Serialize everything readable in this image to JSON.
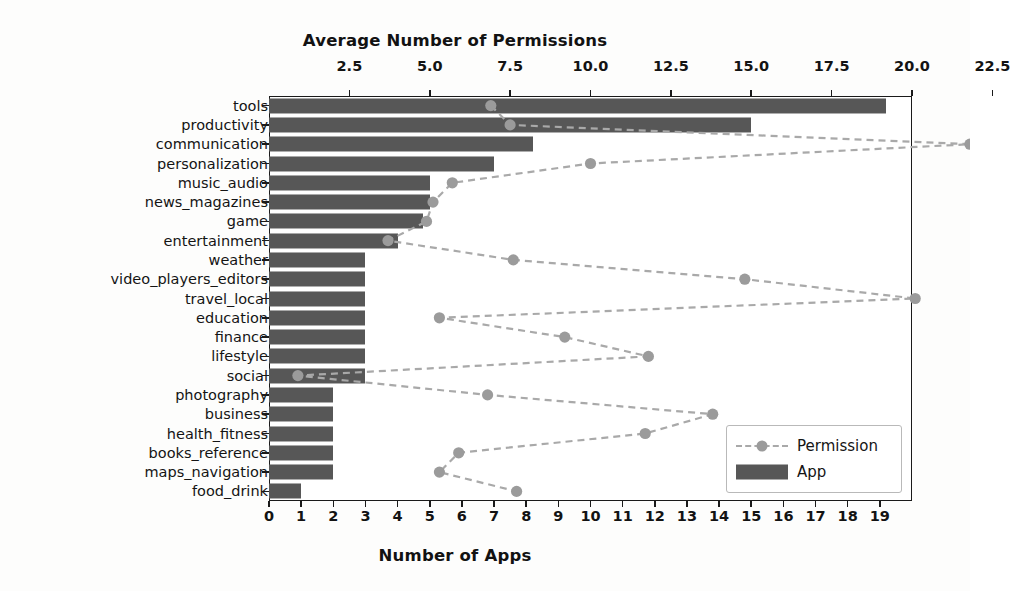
{
  "chart_data": {
    "type": "bar",
    "title": "",
    "xlabel": "Number of Apps",
    "ylabel": "",
    "top_axis_label": "Average Number of Permissions",
    "grid": false,
    "legend_position": "lower right",
    "orientation": "horizontal",
    "categories": [
      "tools",
      "productivity",
      "communication",
      "personalization",
      "music_audio",
      "news_magazines",
      "game",
      "entertainment",
      "weather",
      "video_players_editors",
      "travel_local",
      "education",
      "finance",
      "lifestyle",
      "social",
      "photography",
      "business",
      "health_fitness",
      "books_reference",
      "maps_navigation",
      "food_drink"
    ],
    "series": [
      {
        "name": "App",
        "axis": "bottom",
        "type": "bar",
        "color": "#575757",
        "values": [
          19.2,
          15.0,
          8.2,
          7.0,
          5.0,
          5.0,
          4.8,
          4.0,
          3.0,
          3.0,
          3.0,
          3.0,
          3.0,
          3.0,
          3.0,
          2.0,
          2.0,
          2.0,
          2.0,
          2.0,
          1.0
        ]
      },
      {
        "name": "Permission",
        "axis": "top",
        "type": "line",
        "color": "#a9a9a9",
        "marker": "o",
        "linestyle": "dashed",
        "values": [
          6.9,
          7.5,
          21.8,
          10.0,
          5.7,
          5.1,
          4.9,
          3.7,
          7.6,
          14.8,
          20.1,
          5.3,
          9.2,
          11.8,
          0.9,
          6.8,
          13.8,
          11.7,
          5.9,
          5.3,
          7.7
        ]
      }
    ],
    "bottom_axis": {
      "ticks": [
        "0",
        "1",
        "2",
        "3",
        "4",
        "5",
        "6",
        "7",
        "8",
        "9",
        "10",
        "11",
        "12",
        "13",
        "14",
        "15",
        "16",
        "17",
        "18",
        "19"
      ],
      "min": 0,
      "max": 20
    },
    "top_axis": {
      "ticks": [
        "2.5",
        "5.0",
        "7.5",
        "10.0",
        "12.5",
        "15.0",
        "17.5",
        "20.0",
        "22.5"
      ],
      "min": 0,
      "max": 20
    }
  },
  "legend": {
    "items": [
      {
        "label": "Permission"
      },
      {
        "label": "App"
      }
    ]
  }
}
